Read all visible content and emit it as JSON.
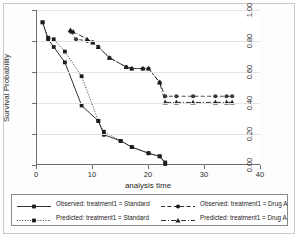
{
  "chart_data": {
    "type": "line",
    "title": "",
    "xlabel": "analysis time",
    "ylabel": "Survival Probability",
    "xlim": [
      0,
      40
    ],
    "ylim": [
      0,
      1.0
    ],
    "xticks": [
      0,
      10,
      20,
      30,
      40
    ],
    "xtick_labels": [
      "0",
      "10",
      "20",
      "30",
      "40"
    ],
    "yticks": [
      0.0,
      0.2,
      0.4,
      0.6,
      0.8,
      1.0
    ],
    "ytick_labels": [
      "0.00",
      "0.20",
      "0.40",
      "0.60",
      "0.80",
      "1.00"
    ],
    "grid": "horizontal",
    "legend_position": "bottom",
    "series": [
      {
        "name": "Observed: treatment1 = Standard",
        "marker": "square",
        "linestyle": "solid",
        "color": "#1c1c1c",
        "x": [
          1,
          2,
          3,
          5,
          8,
          11,
          12,
          15,
          17,
          20,
          22,
          23
        ],
        "y": [
          0.92,
          0.81,
          0.76,
          0.66,
          0.38,
          0.28,
          0.19,
          0.15,
          0.11,
          0.07,
          0.05,
          0.01
        ]
      },
      {
        "name": "Predicted: treatment1 = Standard",
        "marker": "square",
        "linestyle": "dotted",
        "color": "#1c1c1c",
        "x": [
          1,
          2,
          3,
          5,
          8,
          11,
          12,
          15,
          17,
          20,
          22,
          23
        ],
        "y": [
          0.92,
          0.82,
          0.81,
          0.73,
          0.57,
          0.28,
          0.21,
          0.15,
          0.11,
          0.07,
          0.05,
          0.0
        ]
      },
      {
        "name": "Observed: treatment1 = Drug A",
        "marker": "circle",
        "linestyle": "dashed",
        "color": "#3a3a3a",
        "x": [
          6,
          7,
          9,
          10,
          11,
          13,
          16,
          17,
          19,
          20,
          22,
          23,
          25,
          28,
          32,
          34,
          35
        ],
        "y": [
          0.86,
          0.81,
          0.8,
          0.79,
          0.76,
          0.69,
          0.63,
          0.62,
          0.62,
          0.62,
          0.53,
          0.44,
          0.44,
          0.44,
          0.44,
          0.44,
          0.44
        ]
      },
      {
        "name": "Predicted: treatment1 = Drug A",
        "marker": "triangle",
        "linestyle": "dashdot",
        "color": "#1c1c1c",
        "x": [
          6,
          6.5,
          9,
          10,
          11,
          13,
          16,
          17,
          19,
          20,
          22,
          23,
          25,
          28,
          32,
          34,
          35
        ],
        "y": [
          0.87,
          0.86,
          0.81,
          0.79,
          0.76,
          0.69,
          0.63,
          0.62,
          0.62,
          0.62,
          0.53,
          0.4,
          0.4,
          0.4,
          0.4,
          0.4,
          0.4
        ]
      }
    ]
  },
  "legend": {
    "items": [
      {
        "label": "Observed: treatment1 = Standard",
        "marker": "square",
        "linestyle": "solid"
      },
      {
        "label": "Observed: treatment1 = Drug A",
        "marker": "circle",
        "linestyle": "dashed"
      },
      {
        "label": "Predicted: treatment1 = Standard",
        "marker": "square",
        "linestyle": "dotted"
      },
      {
        "label": "Predicted: treatment1 = Drug A",
        "marker": "triangle",
        "linestyle": "dashdot"
      }
    ]
  },
  "colors": {
    "axis": "#6e6e6e",
    "grid": "#e3e3e3",
    "text": "#2b2b2b",
    "series_dark": "#1c1c1c",
    "background": "#ffffff",
    "frame": "#c9c9c9"
  }
}
